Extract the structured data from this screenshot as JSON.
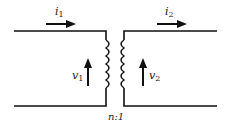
{
  "diagram": {
    "type": "ideal transformer",
    "labels": {
      "i1": "i",
      "i1_sub": "1",
      "i2": "i",
      "i2_sub": "2",
      "v1": "v",
      "v1_sub": "1",
      "v2": "v",
      "v2_sub": "2",
      "ratio": "n:1"
    },
    "colors": {
      "stroke": "#111111",
      "background": "#ffffff"
    }
  }
}
